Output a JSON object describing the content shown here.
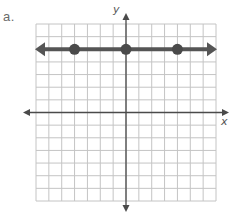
{
  "problem": {
    "label": "a."
  },
  "chart_data": {
    "type": "line",
    "title": "",
    "xlabel": "x",
    "ylabel": "y",
    "xlim": [
      -7,
      7
    ],
    "ylim": [
      -7,
      7
    ],
    "grid": true,
    "grid_step": 1,
    "tick_labels": false,
    "series": [
      {
        "name": "horizontal line y = 5",
        "equation": "y = 5",
        "arrows_both_ends": true,
        "points": [
          {
            "x": -4,
            "y": 5
          },
          {
            "x": 0,
            "y": 5
          },
          {
            "x": 4,
            "y": 5
          }
        ]
      }
    ]
  },
  "colors": {
    "grid": "#c4c4c4",
    "axis": "#4a4a4a",
    "line": "#555555",
    "point": "#4a4a4a",
    "label": "#6a6a6a"
  }
}
